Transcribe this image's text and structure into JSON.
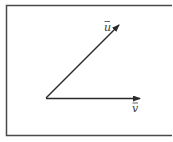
{
  "diagram": {
    "title": "",
    "vectors": [
      {
        "name": "u",
        "label": "u",
        "label_accent": "→"
      },
      {
        "name": "v",
        "label": "v",
        "label_accent": "→"
      }
    ],
    "colors": {
      "stroke": "#2a2a2a",
      "frame": "#4a4a4a",
      "background": "#ffffff"
    }
  }
}
